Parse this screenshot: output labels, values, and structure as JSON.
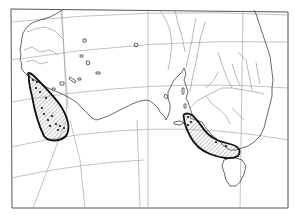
{
  "map": {
    "type": "distribution-map",
    "region": "southern Australia",
    "colors": {
      "background": "#ffffff",
      "frame": "#555555",
      "graticule": "#9a9a9a",
      "coastline": "#444444",
      "river": "#8a8a8a",
      "range_outline": "#111111",
      "range_hatch": "#6a6a6a",
      "locality_dot": "#111111"
    },
    "features": {
      "frame": true,
      "graticule": true,
      "rivers": true,
      "islands": [
        "Kangaroo Island",
        "Tasmania"
      ]
    },
    "ranges": [
      {
        "name": "western-range",
        "location": "south-west Western Australia",
        "fill": "hatched",
        "localities": 14
      },
      {
        "name": "eastern-range",
        "location": "Victoria / south-east South Australia",
        "fill": "hatched",
        "localities": 5
      }
    ]
  }
}
